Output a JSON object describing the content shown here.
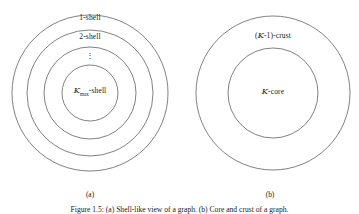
{
  "figure": {
    "caption": "Figure 1.5: (a) Shell-like view of a graph. (b) Core and crust of a graph.",
    "panels": [
      {
        "id": "a",
        "subcaption": "(a)",
        "type": "concentric-shells",
        "center": {
          "x": 90,
          "y": 93
        },
        "radii": [
          78,
          63,
          46,
          28
        ],
        "labels": {
          "shell_1": "1-shell",
          "shell_2": "2-shell",
          "ellipsis": "⋮",
          "shell_max_prefix": "K",
          "shell_max_subscript": "max",
          "shell_max_suffix": "-shell"
        }
      },
      {
        "id": "b",
        "subcaption": "(b)",
        "type": "core-crust",
        "center": {
          "x": 273,
          "y": 93
        },
        "radii": [
          77,
          45
        ],
        "labels": {
          "crust_prefix": "(",
          "crust_symbol": "K",
          "crust_suffix": "-1)-crust",
          "core_symbol": "K",
          "core_suffix": "-core"
        }
      }
    ],
    "colors": {
      "background": "#ffffff",
      "stroke": "#4a4a4a",
      "text": "#1a1a1a"
    }
  }
}
